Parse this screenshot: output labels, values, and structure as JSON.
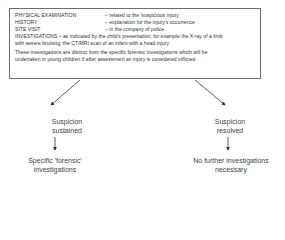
{
  "box": {
    "rows": [
      {
        "key": "PHYSICAL EXAMINATION",
        "value": "– related to the 'suspicious injury"
      },
      {
        "key": "HISTORY",
        "value": "– explanation for the injury's occurrence"
      },
      {
        "key": "SITE VISIT",
        "value": "– in the company of police"
      }
    ],
    "investigations_line1": "INVESTIGATIONS – as indicated by the child's presentation, for example the X-ray of a limb",
    "investigations_line2": "with severe bruising, the CT/MRI scan of an infant with a head injury.",
    "note_line1": "These investigations are distinct from the specific forensic investigations which will be",
    "note_line2": "undertaken in young children if after assessment an injury is considered inflicted"
  },
  "left_branch": {
    "outcome_line1": "Suspicion",
    "outcome_line2": "sustained",
    "result_line1": "Specific 'forensic'",
    "result_line2": "investigations"
  },
  "right_branch": {
    "outcome_line1": "Suspicion",
    "outcome_line2": "resolved",
    "result_line1": "No further investigations",
    "result_line2": "necessary"
  },
  "colors": {
    "border": "#6e6e6e",
    "text": "#3a3a3a",
    "arrow": "#333333"
  }
}
